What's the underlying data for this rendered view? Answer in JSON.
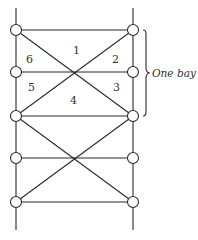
{
  "diagram": {
    "type": "truss-frame",
    "columns": 2,
    "joints_per_column": 5,
    "bays": 2,
    "colors": {
      "stroke": "#2a2a2a",
      "text": "#333333",
      "background": "#ffffff"
    },
    "region_labels": [
      "1",
      "2",
      "3",
      "4",
      "5",
      "6"
    ],
    "annotation": "One bay"
  }
}
